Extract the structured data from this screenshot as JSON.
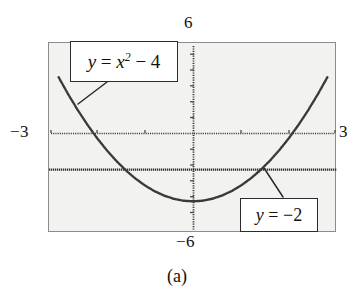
{
  "figure": {
    "caption": "(a)",
    "background_color": "#ffffff",
    "plot_background_color": "#f2f2f1",
    "frame_color": "#8c8c8c",
    "curve_color": "#3a3a3a"
  },
  "axes": {
    "x_min_label": "−3",
    "x_max_label": "3",
    "y_min_label": "−6",
    "y_max_label": "6",
    "x_range": [
      -3,
      3
    ],
    "y_range": [
      -6,
      6
    ],
    "x_tick_step": 1,
    "y_tick_step": 1,
    "style": "dotted calculator-style axes with tick marks"
  },
  "callouts": [
    {
      "name": "parabola-label",
      "text": "y = x² − 4",
      "lhs": "y",
      "equals": "=",
      "base": "x",
      "exponent": "2",
      "tail": "− 4"
    },
    {
      "name": "horizontal-line-label",
      "text": "y = −2",
      "lhs": "y",
      "equals": "=",
      "tail": "−2"
    }
  ],
  "chart_data": {
    "type": "line",
    "title": "",
    "subtitle": "",
    "xlabel": "",
    "ylabel": "",
    "xlim": [
      -3,
      3
    ],
    "ylim": [
      -6,
      6
    ],
    "grid": false,
    "legend": "inline callout boxes",
    "annotations": [
      {
        "text": "y = x² − 4",
        "points_to": [
          -2.15,
          0.6
        ]
      },
      {
        "text": "y = −2",
        "points_to": [
          1.45,
          -1.95
        ]
      }
    ],
    "tick_labels": {
      "x": [
        "−3",
        "3"
      ],
      "y": [
        "−6",
        "6"
      ]
    },
    "series": [
      {
        "name": "y = x^2 - 4",
        "style": "dotted",
        "equation": "y = x^2 - 4",
        "x": [
          -2.8,
          -2.6,
          -2.4,
          -2.2,
          -2.0,
          -1.8,
          -1.6,
          -1.4,
          -1.2,
          -1.0,
          -0.8,
          -0.6,
          -0.4,
          -0.2,
          0.0,
          0.2,
          0.4,
          0.6,
          0.8,
          1.0,
          1.2,
          1.4,
          1.6,
          1.8,
          2.0,
          2.2,
          2.4,
          2.6,
          2.8
        ],
        "values": [
          3.84,
          2.76,
          1.76,
          0.84,
          0.0,
          -0.76,
          -1.44,
          -2.04,
          -2.56,
          -3.0,
          -3.36,
          -3.64,
          -3.84,
          -3.96,
          -4.0,
          -3.96,
          -3.84,
          -3.64,
          -3.36,
          -3.0,
          -2.56,
          -2.04,
          -1.44,
          -0.76,
          0.0,
          0.84,
          1.76,
          2.76,
          3.84
        ]
      },
      {
        "name": "y = -2",
        "style": "dotted",
        "equation": "y = -2",
        "x": [
          -3,
          3
        ],
        "values": [
          -2,
          -2
        ]
      }
    ],
    "intersections": [
      {
        "x": -1.414,
        "y": -2
      },
      {
        "x": 1.414,
        "y": -2
      }
    ]
  }
}
